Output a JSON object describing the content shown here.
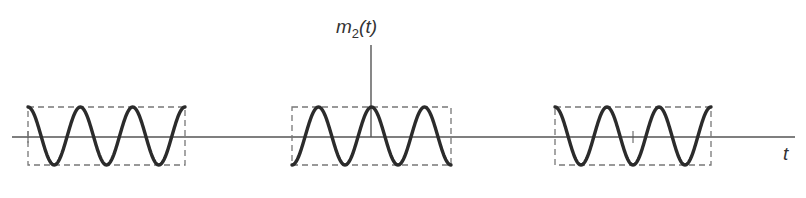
{
  "figure": {
    "signal_label": "m",
    "signal_subscript": "2",
    "signal_arg": "(t)",
    "time_axis_label": "t",
    "colors": {
      "waveform": "#2b2b2b",
      "axis": "#555555",
      "envelope": "#777777",
      "background": "#ffffff"
    },
    "axis_y_px": 137,
    "vertical_axis_x_px": 371,
    "pulses": [
      {
        "name": "left-pulse",
        "x_start": 28,
        "x_end": 185,
        "top": 107,
        "bottom": 165,
        "cycles": 3,
        "start_phase": "max"
      },
      {
        "name": "center-pulse",
        "x_start": 292,
        "x_end": 451,
        "top": 107,
        "bottom": 165,
        "cycles": 3,
        "start_phase": "min"
      },
      {
        "name": "right-pulse",
        "x_start": 555,
        "x_end": 711,
        "top": 107,
        "bottom": 165,
        "cycles": 3,
        "start_phase": "max"
      }
    ]
  }
}
